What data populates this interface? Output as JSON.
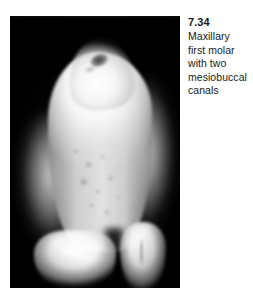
{
  "figure": {
    "number": "7.34",
    "caption_full": "Maxillary first molar with two mesiobuccal canals",
    "caption_lines": [
      "Maxillary",
      "first molar",
      "with two",
      "mesiobuccal",
      "canals"
    ]
  },
  "photo": {
    "alt_name": "extracted-maxillary-first-molar-photograph",
    "background_color": "#000000",
    "specimen_color": "#ffffff",
    "features": [
      "apical canal orifice",
      "mesiobuccal root",
      "distobuccal root",
      "palatal root"
    ]
  },
  "page": {
    "background_color": "#ffffff",
    "text_color": "#1a1a1a"
  }
}
